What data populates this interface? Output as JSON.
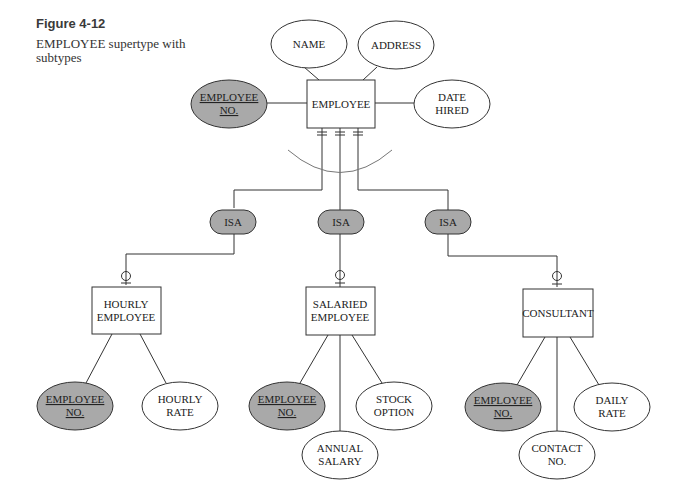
{
  "figure": {
    "label": "Figure 4-12",
    "caption": "EMPLOYEE supertype with subtypes"
  },
  "colors": {
    "key_attribute_fill": "#a9a9a9",
    "isa_fill": "#a9a9a9",
    "line": "#333333",
    "arc": "#777777"
  },
  "supertype": {
    "name": "EMPLOYEE",
    "attributes": {
      "key": [
        "EMPLOYEE",
        "NO."
      ],
      "name": "NAME",
      "address": "ADDRESS",
      "date_hired": [
        "DATE",
        "HIRED"
      ]
    }
  },
  "isa_label": "ISA",
  "subtypes": [
    {
      "name": [
        "HOURLY",
        "EMPLOYEE"
      ],
      "key": [
        "EMPLOYEE",
        "NO."
      ],
      "attributes": [
        [
          "HOURLY",
          "RATE"
        ]
      ]
    },
    {
      "name": [
        "SALARIED",
        "EMPLOYEE"
      ],
      "key": [
        "EMPLOYEE",
        "NO."
      ],
      "attributes": [
        [
          "STOCK",
          "OPTION"
        ],
        [
          "ANNUAL",
          "SALARY"
        ]
      ]
    },
    {
      "name": [
        "CONSULTANT"
      ],
      "key": [
        "EMPLOYEE",
        "NO."
      ],
      "attributes": [
        [
          "DAILY",
          "RATE"
        ],
        [
          "CONTACT",
          "NO."
        ]
      ]
    }
  ]
}
